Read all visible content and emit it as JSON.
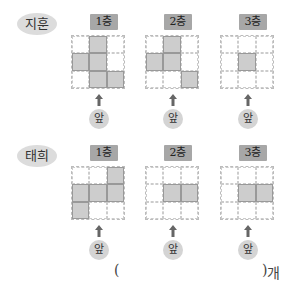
{
  "front_label": "앞",
  "people": [
    {
      "name": "지훈",
      "floors": [
        {
          "label": "1층",
          "cells": [
            0,
            1,
            0,
            1,
            1,
            0,
            0,
            1,
            1
          ]
        },
        {
          "label": "2층",
          "cells": [
            0,
            1,
            0,
            1,
            1,
            0,
            0,
            0,
            1
          ]
        },
        {
          "label": "3층",
          "cells": [
            0,
            0,
            0,
            0,
            1,
            0,
            0,
            0,
            0
          ]
        }
      ]
    },
    {
      "name": "태희",
      "floors": [
        {
          "label": "1층",
          "cells": [
            0,
            0,
            1,
            1,
            1,
            1,
            1,
            0,
            0
          ]
        },
        {
          "label": "2층",
          "cells": [
            0,
            0,
            0,
            0,
            1,
            1,
            0,
            0,
            0
          ]
        },
        {
          "label": "3층",
          "cells": [
            0,
            0,
            0,
            0,
            1,
            1,
            0,
            0,
            0
          ]
        }
      ]
    }
  ],
  "answer": {
    "open": "(",
    "close": ")",
    "unit": "개",
    "value": ""
  },
  "colors": {
    "filled": "#cdcdcd",
    "badge": "#a7a7a7",
    "name_bg": "#dcdcdc"
  }
}
